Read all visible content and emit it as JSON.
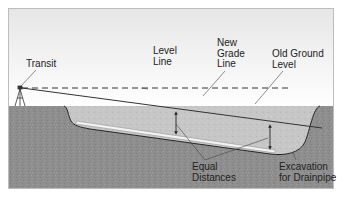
{
  "diagram": {
    "labels": {
      "transit": "Transit",
      "level_line": [
        "Level",
        "Line"
      ],
      "new_grade_line": [
        "New",
        "Grade",
        "Line"
      ],
      "old_ground_level": [
        "Old Ground",
        "Level"
      ],
      "equal_distances": [
        "Equal",
        "Distances"
      ],
      "excavation": [
        "Excavation",
        "for Drainpipe"
      ]
    },
    "colors": {
      "sky_top": "#e9e9e9",
      "sky_bottom": "#ffffff",
      "earth": "#8f8f8f",
      "fill_soil": "#c4c4c4",
      "pipe": "#f2f2f2",
      "line": "#333333",
      "frame": "#bdbdbd"
    }
  }
}
